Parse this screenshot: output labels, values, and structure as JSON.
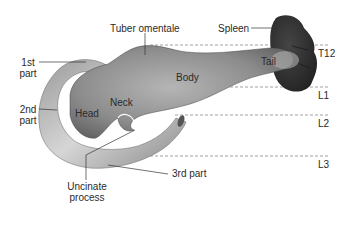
{
  "figure": {
    "labels": {
      "tuber_omentale": "Tuber omentale",
      "spleen": "Spleen",
      "tail": "Tail",
      "body": "Body",
      "neck": "Neck",
      "head": "Head",
      "first_part_line1": "1st",
      "first_part_line2": "part",
      "second_part_line1": "2nd",
      "second_part_line2": "part",
      "third_part": "3rd part",
      "uncinate_line1": "Uncinate",
      "uncinate_line2": "process"
    },
    "vertebral_levels": [
      "T12",
      "L1",
      "L2",
      "L3"
    ],
    "caption": ""
  },
  "colors": {
    "pancreas": "#8a8a8a",
    "spleen": "#2e2e2e",
    "duodenum": "#b8b8b8",
    "text": "#2a2a2a",
    "dashed_line": "#888888"
  }
}
